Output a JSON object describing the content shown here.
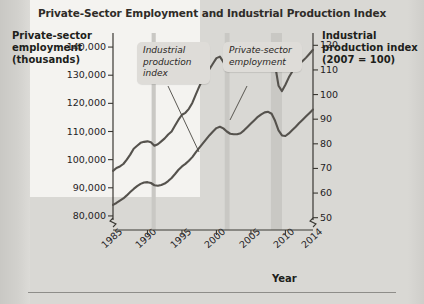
{
  "chart_data": {
    "type": "line",
    "title": "Private-Sector Employment and Industrial Production Index",
    "xlabel": "Year",
    "ylabel": "Private-sector employment (thousands)",
    "ylabel_right": "Industrial production index (2007 = 100)",
    "xlim": [
      1985,
      2014
    ],
    "xticks": [
      "1985",
      "1990",
      "1995",
      "2000",
      "2005",
      "2010",
      "2014"
    ],
    "xtick_values": [
      1985,
      1990,
      1995,
      2000,
      2005,
      2010,
      2014
    ],
    "ylim": [
      75000,
      145000
    ],
    "yticks": [
      "80,000",
      "90,000",
      "100,000",
      "110,000",
      "120,000",
      "130,000",
      "140,000"
    ],
    "ytick_values": [
      80000,
      90000,
      100000,
      110000,
      120000,
      130000,
      140000
    ],
    "ylim_right": [
      45,
      125
    ],
    "yticks_right": [
      "50",
      "60",
      "70",
      "80",
      "90",
      "100",
      "110",
      "120"
    ],
    "ytick_values_right": [
      50,
      60,
      70,
      80,
      90,
      100,
      110,
      120
    ],
    "grid": false,
    "legend": "annotations",
    "axis_break_left": true,
    "axis_break_right": true,
    "annotations": [
      {
        "label": "Industrial production index",
        "points_to": "industrial-production-series"
      },
      {
        "label": "Private-sector employment",
        "points_to": "employment-series"
      }
    ],
    "shaded_bands": [
      {
        "name": "recession-1990-1991",
        "start": 1990.6,
        "end": 1991.2
      },
      {
        "name": "recession-2001",
        "start": 2001.2,
        "end": 2001.9
      },
      {
        "name": "recession-2007-2009",
        "start": 2007.9,
        "end": 2009.5
      }
    ],
    "series": [
      {
        "name": "Private-sector employment",
        "axis": "left",
        "units": "thousands",
        "x": [
          1985.0,
          1985.5,
          1986.0,
          1986.5,
          1987.0,
          1987.5,
          1988.0,
          1988.5,
          1989.0,
          1989.5,
          1990.0,
          1990.5,
          1991.0,
          1991.5,
          1992.0,
          1992.5,
          1993.0,
          1993.5,
          1994.0,
          1994.5,
          1995.0,
          1995.5,
          1996.0,
          1996.5,
          1997.0,
          1997.5,
          1998.0,
          1998.5,
          1999.0,
          1999.5,
          2000.0,
          2000.5,
          2001.0,
          2001.5,
          2002.0,
          2002.5,
          2003.0,
          2003.5,
          2004.0,
          2004.5,
          2005.0,
          2005.5,
          2006.0,
          2006.5,
          2007.0,
          2007.5,
          2008.0,
          2008.5,
          2009.0,
          2009.5,
          2010.0,
          2010.5,
          2011.0,
          2011.5,
          2012.0,
          2012.5,
          2013.0,
          2013.5,
          2014.0
        ],
        "y": [
          83900,
          84600,
          85400,
          86200,
          87300,
          88500,
          89600,
          90600,
          91400,
          91900,
          92000,
          91700,
          90900,
          90700,
          91000,
          91500,
          92400,
          93500,
          94900,
          96400,
          97600,
          98500,
          99600,
          100900,
          102600,
          104200,
          105700,
          107200,
          108700,
          110000,
          111200,
          111700,
          111100,
          110000,
          109200,
          109000,
          109000,
          109400,
          110400,
          111600,
          112800,
          114000,
          115200,
          116100,
          116800,
          117000,
          116300,
          113800,
          110400,
          108600,
          108400,
          109300,
          110500,
          111700,
          113000,
          114200,
          115400,
          116600,
          117800
        ]
      },
      {
        "name": "Industrial production index",
        "axis": "right",
        "units": "index, 2007 = 100",
        "x": [
          1985.0,
          1985.5,
          1986.0,
          1986.5,
          1987.0,
          1987.5,
          1988.0,
          1988.5,
          1989.0,
          1989.5,
          1990.0,
          1990.5,
          1991.0,
          1991.5,
          1992.0,
          1992.5,
          1993.0,
          1993.5,
          1994.0,
          1994.5,
          1995.0,
          1995.5,
          1996.0,
          1996.5,
          1997.0,
          1997.5,
          1998.0,
          1998.5,
          1999.0,
          1999.5,
          2000.0,
          2000.5,
          2001.0,
          2001.5,
          2002.0,
          2002.5,
          2003.0,
          2003.5,
          2004.0,
          2004.5,
          2005.0,
          2005.5,
          2006.0,
          2006.5,
          2007.0,
          2007.5,
          2008.0,
          2008.5,
          2009.0,
          2009.5,
          2010.0,
          2010.5,
          2011.0,
          2011.5,
          2012.0,
          2012.5,
          2013.0,
          2013.5,
          2014.0
        ],
        "y": [
          69.0,
          70.2,
          70.8,
          71.8,
          73.6,
          75.6,
          78.0,
          79.2,
          80.4,
          80.8,
          81.0,
          80.6,
          79.2,
          79.8,
          81.0,
          82.2,
          83.8,
          85.0,
          87.4,
          89.8,
          91.8,
          92.6,
          94.2,
          96.6,
          100.0,
          103.2,
          106.2,
          108.2,
          110.4,
          112.6,
          114.8,
          115.4,
          113.2,
          110.8,
          110.2,
          111.4,
          111.8,
          112.6,
          114.6,
          116.4,
          118.0,
          118.4,
          119.6,
          120.2,
          120.6,
          120.4,
          118.2,
          112.0,
          103.6,
          101.4,
          104.0,
          107.0,
          109.4,
          110.6,
          112.4,
          113.6,
          115.0,
          116.6,
          118.2
        ]
      }
    ]
  }
}
